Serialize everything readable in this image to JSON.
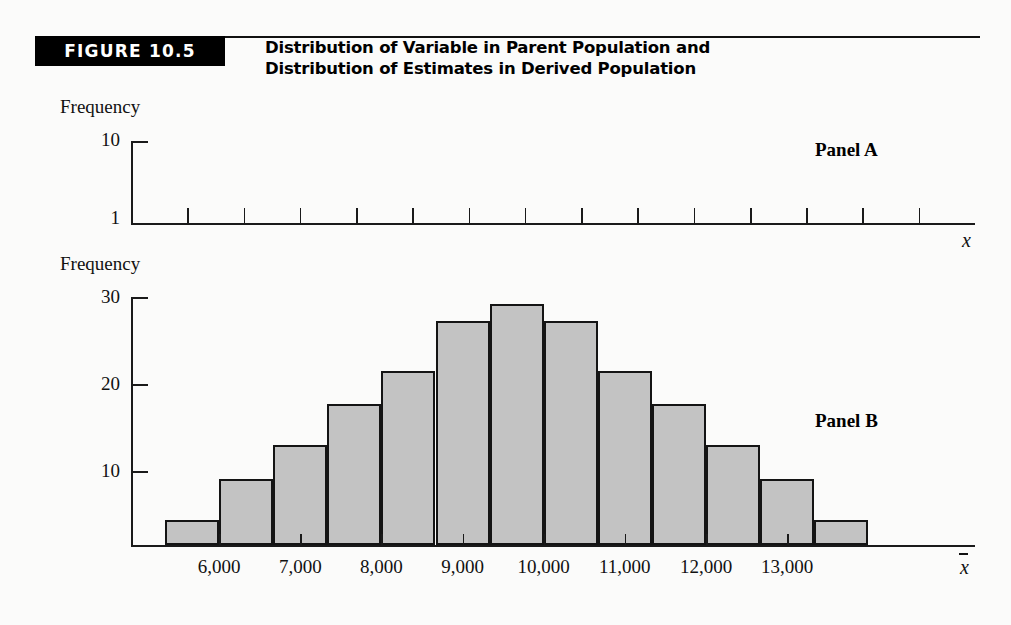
{
  "figure": {
    "badge_label": "FIGURE 10.5",
    "title_line1": "Distribution of Variable in Parent Population and",
    "title_line2": "Distribution of Estimates in Derived Population"
  },
  "panel_a": {
    "tag": "Panel A",
    "y_axis_label": "Frequency",
    "y_ticks": [
      "10",
      "1"
    ],
    "x_axis_label": "x"
  },
  "panel_b": {
    "tag": "Panel B",
    "y_axis_label": "Frequency",
    "y_ticks": [
      "30",
      "20",
      "10"
    ],
    "x_axis_label": "x",
    "x_tick_labels": [
      "6,000",
      "7,000",
      "8,000",
      "9,000",
      "10,000",
      "11,000",
      "12,000",
      "13,000"
    ]
  },
  "colors": {
    "bar_fill": "#c3c3c3",
    "bar_stroke": "#141414",
    "badge_bg": "#000000",
    "page_bg": "#fbfbfa"
  },
  "chart_data": [
    {
      "type": "bar",
      "title": "Panel A — Distribution of Variable in Parent Population",
      "xlabel": "x",
      "ylabel": "Frequency",
      "ylim": [
        1,
        10
      ],
      "ytick_values": [
        1,
        10
      ],
      "grid": false,
      "legend": "none",
      "note": "Axis frame only; no bars are drawn in Panel A. Fourteen evenly spaced tick marks sit on the x-axis.",
      "categories": [],
      "values": []
    },
    {
      "type": "bar",
      "title": "Panel B — Distribution of Estimates in Derived Population",
      "xlabel": "x̄",
      "ylabel": "Frequency",
      "ylim": [
        0,
        30
      ],
      "ytick_values": [
        10,
        20,
        30
      ],
      "xtick_values": [
        6000,
        7000,
        8000,
        9000,
        10000,
        11000,
        12000,
        13000
      ],
      "grid": false,
      "legend": "none",
      "bin_width": 500,
      "categories": [
        "5,500",
        "6,000",
        "6,500",
        "7,000",
        "7,500",
        "8,000",
        "8,500",
        "9,000",
        "9,500",
        "10,000",
        "10,500",
        "11,000",
        "11,500",
        "12,000"
      ],
      "values": [
        3,
        8,
        12,
        17,
        21,
        27,
        29,
        27,
        21,
        17,
        12,
        8,
        3
      ]
    }
  ]
}
